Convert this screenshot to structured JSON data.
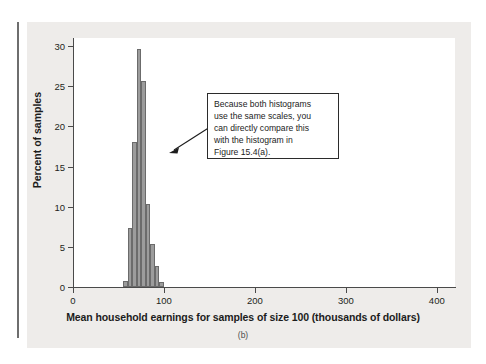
{
  "figure": {
    "caption": "(b)",
    "background_color": "#eeecea",
    "plot_background_color": "#ffffff",
    "axis_color": "#4a4a4a"
  },
  "annotation": {
    "lines": [
      "Because both histograms",
      "use the same scales, you",
      "can directly compare this",
      "with the histogram in",
      "Figure 15.4(a)."
    ],
    "text": "Because both histograms use the same scales, you can directly compare this with the histogram in Figure 15.4(a).",
    "arrow": "arrow-pointing-left-down-to-histogram"
  },
  "chart_data": {
    "type": "bar",
    "title": "",
    "subtitle": "",
    "xlabel": "Mean household earnings for samples of size 100 (thousands of dollars)",
    "ylabel": "Percent of samples",
    "xlim": [
      0,
      420
    ],
    "ylim": [
      0,
      31
    ],
    "xticks": [
      0,
      100,
      200,
      300,
      400
    ],
    "xtick_labels": [
      "0",
      "100",
      "200",
      "300",
      "400"
    ],
    "yticks": [
      0,
      5,
      10,
      15,
      20,
      25,
      30
    ],
    "ytick_labels": [
      "0",
      "5",
      "10",
      "15",
      "20",
      "25",
      "30"
    ],
    "grid": false,
    "legend": null,
    "bar_fill_color": "#9c9c9c",
    "bar_edge_color": "#6b6b6b",
    "bin_width": 5,
    "bins": [
      {
        "left": 55,
        "right": 60,
        "value": 0.8
      },
      {
        "left": 60,
        "right": 65,
        "value": 7.3
      },
      {
        "left": 65,
        "right": 70,
        "value": 18.0
      },
      {
        "left": 70,
        "right": 75,
        "value": 29.6
      },
      {
        "left": 75,
        "right": 80,
        "value": 25.6
      },
      {
        "left": 80,
        "right": 85,
        "value": 10.3
      },
      {
        "left": 85,
        "right": 90,
        "value": 5.4
      },
      {
        "left": 90,
        "right": 95,
        "value": 2.6
      },
      {
        "left": 95,
        "right": 100,
        "value": 0.6
      }
    ],
    "categories": [
      "55-60",
      "60-65",
      "65-70",
      "70-75",
      "75-80",
      "80-85",
      "85-90",
      "90-95",
      "95-100"
    ],
    "values": [
      0.8,
      7.3,
      18.0,
      29.6,
      25.6,
      10.3,
      5.4,
      2.6,
      0.6
    ]
  }
}
